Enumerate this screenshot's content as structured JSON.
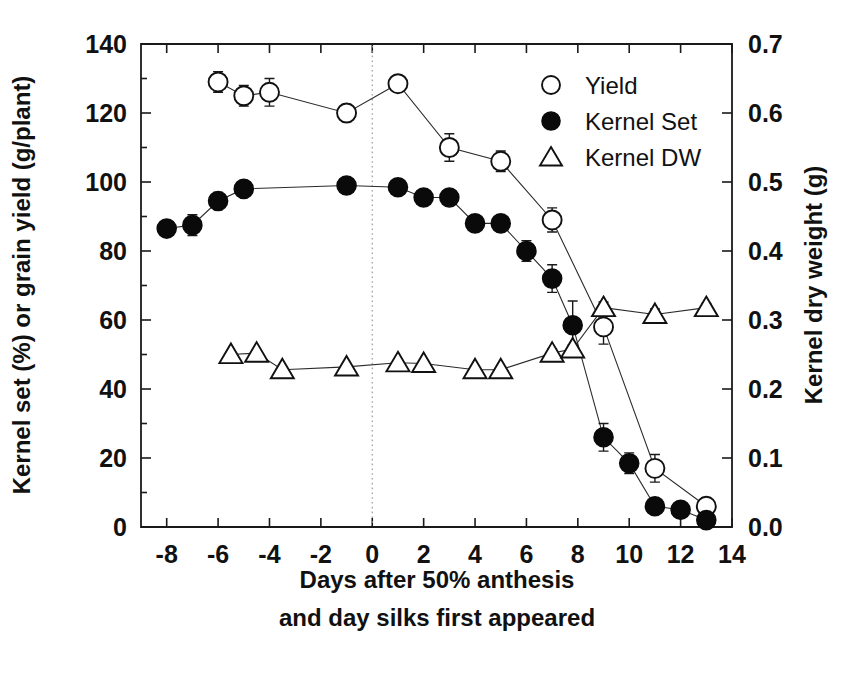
{
  "chart_data": {
    "type": "line",
    "title": "",
    "xlabel": "Days after 50% anthesis and day silks first appeared",
    "xlabel_line1": "Days after 50% anthesis",
    "xlabel_line2": "and day silks first appeared",
    "ylabel_left": "Kernel set (%) or grain yield (g/plant)",
    "ylabel_right": "Kernel dry weight (g)",
    "xlim": [
      -9,
      14
    ],
    "ylim_left": [
      0,
      140
    ],
    "ylim_right": [
      0.0,
      0.7
    ],
    "xticks": [
      -8,
      -6,
      -4,
      -2,
      0,
      2,
      4,
      6,
      8,
      10,
      12,
      14
    ],
    "xticklabels": [
      "-8",
      "-6",
      "-4",
      "-2",
      "0",
      "2",
      "4",
      "6",
      "8",
      "10",
      "12",
      "14"
    ],
    "yticks_left": [
      0,
      20,
      40,
      60,
      80,
      100,
      120,
      140
    ],
    "yticklabels_left": [
      "0",
      "20",
      "40",
      "60",
      "80",
      "100",
      "120",
      "140"
    ],
    "yticks_right": [
      0.0,
      0.1,
      0.2,
      0.3,
      0.4,
      0.5,
      0.6,
      0.7
    ],
    "yticklabels_right": [
      "0.0",
      "0.1",
      "0.2",
      "0.3",
      "0.4",
      "0.5",
      "0.6",
      "0.7"
    ],
    "grid": false,
    "legend_position": "top-right",
    "annotations": [
      {
        "name": "anthesis-reference-line",
        "type": "vline",
        "x": 0,
        "style": "dotted"
      }
    ],
    "series": [
      {
        "name": "Yield",
        "marker": "open-circle",
        "axis": "left",
        "x": [
          -6,
          -5,
          -4,
          -1,
          1,
          3,
          5,
          7,
          9,
          11,
          13
        ],
        "values": [
          129,
          125,
          126,
          120,
          128.5,
          110,
          106,
          89,
          58,
          17,
          6
        ],
        "errors": [
          3,
          3,
          4,
          2.5,
          2,
          4,
          3,
          3.5,
          5,
          4,
          2.5
        ]
      },
      {
        "name": "Kernel Set",
        "marker": "filled-circle",
        "axis": "left",
        "x": [
          -8,
          -7,
          -6,
          -5,
          -1,
          1,
          2,
          3,
          4,
          5,
          6,
          7,
          7.8,
          9,
          10,
          11,
          12,
          13
        ],
        "values": [
          86.5,
          87.5,
          94.5,
          98,
          99,
          98.5,
          95.5,
          95.5,
          88,
          88,
          80,
          72,
          58.5,
          26,
          18.5,
          6,
          5,
          2
        ],
        "errors": [
          2,
          3,
          2.5,
          2,
          1.5,
          1.5,
          1.5,
          1.5,
          2,
          2,
          3,
          4,
          7,
          4,
          3,
          1.5,
          1.5,
          1.5
        ]
      },
      {
        "name": "Kernel DW",
        "marker": "open-triangle",
        "axis": "right",
        "x": [
          -5.5,
          -4.5,
          -3.5,
          -1,
          1,
          2,
          4,
          5,
          7,
          7.8,
          9,
          11,
          13
        ],
        "values": [
          0.25,
          0.252,
          0.228,
          0.232,
          0.238,
          0.237,
          0.228,
          0.228,
          0.252,
          0.258,
          0.318,
          0.308,
          0.318
        ],
        "errors": [
          0.004,
          0.004,
          0.004,
          0.004,
          0.004,
          0.004,
          0.004,
          0.004,
          0.006,
          0.006,
          0.008,
          0.008,
          0.006
        ]
      }
    ],
    "legend": [
      {
        "label": "Yield",
        "marker": "open-circle"
      },
      {
        "label": "Kernel Set",
        "marker": "filled-circle"
      },
      {
        "label": "Kernel DW",
        "marker": "open-triangle"
      }
    ],
    "colors": {
      "axis": "#1a1a1a",
      "line": "#2b2b2b",
      "marker_fill_open": "#ffffff",
      "marker_fill_solid": "#0a0a0a",
      "reference_line": "#9a9a9a",
      "background": "#ffffff"
    }
  }
}
